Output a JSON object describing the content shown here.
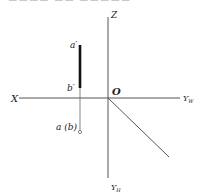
{
  "caption_fragment": "▬▬▬▬  ▬▬ ▬▬▬▬▬",
  "axes": {
    "x_label": "X",
    "z_label": "Z",
    "yw_label": "Y",
    "yw_sub": "W",
    "yh_label": "Y",
    "yh_sub": "H",
    "origin_label": "O"
  },
  "points": {
    "a_prime": "a′",
    "b_prime": "b′",
    "ab_horizontal": "a (b)"
  },
  "colors": {
    "axis": "#555555",
    "segment": "#111111"
  }
}
